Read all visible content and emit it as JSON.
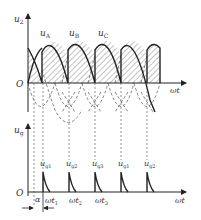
{
  "upper_plot": {
    "y_axis_label": "u",
    "y_axis_sub": "2",
    "x_axis_label": "ωt",
    "origin_label": "O",
    "phase_labels": [
      {
        "main": "u",
        "sub": "A"
      },
      {
        "main": "u",
        "sub": "B"
      },
      {
        "main": "u",
        "sub": "C"
      }
    ]
  },
  "lower_plot": {
    "y_axis_label": "u",
    "y_axis_sub": "g",
    "x_axis_label": "ωt",
    "origin_label": "O",
    "pulse_labels": [
      {
        "main": "u",
        "sub": "g1"
      },
      {
        "main": "u",
        "sub": "g2"
      },
      {
        "main": "u",
        "sub": "g3"
      },
      {
        "main": "u",
        "sub": "g1"
      },
      {
        "main": "u",
        "sub": "g2"
      }
    ],
    "time_labels": [
      {
        "main": "ωt",
        "sub": "1"
      },
      {
        "main": "ωt",
        "sub": "2"
      },
      {
        "main": "ωt",
        "sub": "3"
      }
    ],
    "alpha_label": "α"
  },
  "colors": {
    "line": "#222222",
    "dashed": "#555555",
    "hatch": "#444444",
    "background": "#ffffff"
  }
}
